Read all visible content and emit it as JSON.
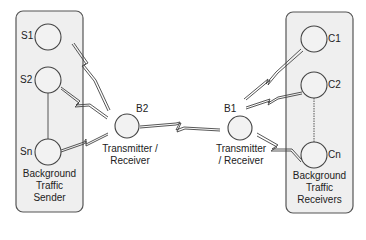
{
  "left_group": {
    "title_lines": [
      "Background",
      "Traffic",
      "Sender"
    ],
    "nodes": [
      {
        "id": "S1",
        "label": "S1"
      },
      {
        "id": "S2",
        "label": "S2"
      },
      {
        "id": "Sn",
        "label": "Sn"
      }
    ]
  },
  "right_group": {
    "title_lines": [
      "Background",
      "Traffic",
      "Receivers"
    ],
    "nodes": [
      {
        "id": "C1",
        "label": "C1"
      },
      {
        "id": "C2",
        "label": "C2"
      },
      {
        "id": "Cn",
        "label": "Cn"
      }
    ]
  },
  "hubs": [
    {
      "id": "B2",
      "label": "B2",
      "role_lines": [
        "Transmitter /",
        "Receiver"
      ]
    },
    {
      "id": "B1",
      "label": "B1",
      "role_lines": [
        "Transmitter",
        "/ Receiver"
      ]
    }
  ],
  "links": [
    {
      "from": "S1",
      "to": "B2",
      "type": "wireless"
    },
    {
      "from": "S2",
      "to": "B2",
      "type": "wireless"
    },
    {
      "from": "Sn",
      "to": "B2",
      "type": "wireless"
    },
    {
      "from": "B2",
      "to": "B1",
      "type": "wireless"
    },
    {
      "from": "B1",
      "to": "C1",
      "type": "wireless"
    },
    {
      "from": "B1",
      "to": "C2",
      "type": "wireless"
    },
    {
      "from": "B1",
      "to": "Cn",
      "type": "wireless"
    }
  ],
  "colors": {
    "box_fill": "#efefef",
    "stroke": "#444444",
    "node_fill": "#f2f2f2"
  }
}
